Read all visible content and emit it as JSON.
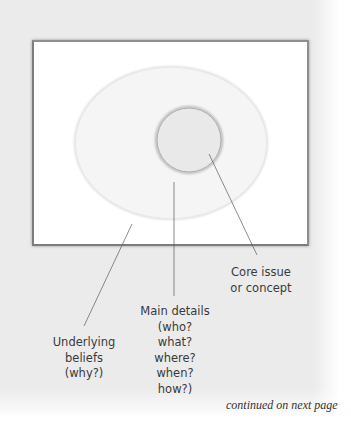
{
  "diagram": {
    "type": "concentric-concept-map",
    "layers": [
      {
        "id": "core",
        "shape": "circle",
        "fill": "#e8e8e8",
        "stroke": "#a8a8a8",
        "label_lines": [
          "Core issue",
          "or concept"
        ]
      },
      {
        "id": "main-details",
        "shape": "ellipse",
        "fill": "#f4f4f4",
        "stroke": "#d8d8d8",
        "label_lines": [
          "Main details",
          "(who?",
          "what?",
          "where?",
          "when?",
          "how?)"
        ]
      },
      {
        "id": "underlying-beliefs",
        "shape": "frame",
        "fill": "#ffffff",
        "label_lines": [
          "Underlying",
          "beliefs",
          "(why?)"
        ]
      }
    ]
  },
  "labels": {
    "core": {
      "line1": "Core issue",
      "line2": "or concept"
    },
    "main_details": {
      "line1": "Main details",
      "line2": "(who?",
      "line3": "what?",
      "line4": "where?",
      "line5": "when?",
      "line6": "how?)"
    },
    "underlying": {
      "line1": "Underlying",
      "line2": "beliefs",
      "line3": "(why?)"
    }
  },
  "footer": {
    "text": "continued on next page"
  },
  "colors": {
    "panel_background": "#ebebeb",
    "frame_background": "#ffffff",
    "frame_border": "#808080",
    "ellipse_fill": "#f4f4f4",
    "ellipse_stroke": "#d6d6d6",
    "circle_fill": "#e8e8e8",
    "circle_stroke": "#a6a6a6",
    "leader_line": "#5a5a5a",
    "text": "#3a3a3a"
  }
}
